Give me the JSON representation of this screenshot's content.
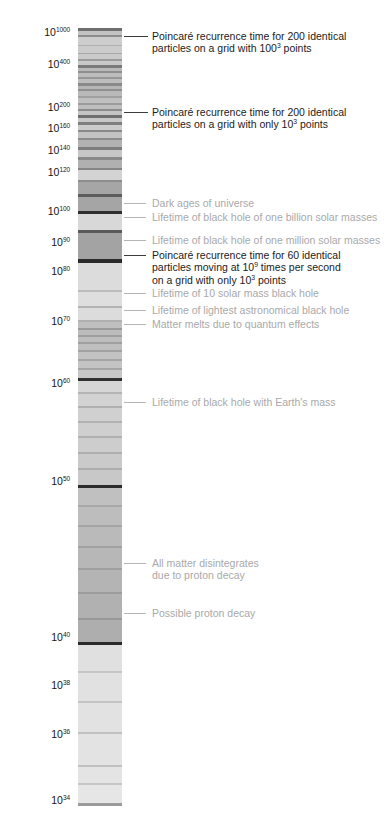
{
  "chart_data": {
    "type": "bar",
    "title": "",
    "subtitle": "",
    "xlabel": "",
    "ylabel": "",
    "orientation": "vertical-log-timeline",
    "scale": "log10-of-log10-years",
    "grid": false,
    "legend_position": "none",
    "axis": {
      "label_prefix": "10",
      "ticks": [
        {
          "exponent": "1000",
          "y": 33
        },
        {
          "exponent": "400",
          "y": 65
        },
        {
          "exponent": "200",
          "y": 108
        },
        {
          "exponent": "160",
          "y": 129
        },
        {
          "exponent": "140",
          "y": 151
        },
        {
          "exponent": "120",
          "y": 173
        },
        {
          "exponent": "100",
          "y": 212
        },
        {
          "exponent": "90",
          "y": 243
        },
        {
          "exponent": "80",
          "y": 272
        },
        {
          "exponent": "70",
          "y": 322
        },
        {
          "exponent": "60",
          "y": 384
        },
        {
          "exponent": "50",
          "y": 482
        },
        {
          "exponent": "40",
          "y": 638
        },
        {
          "exponent": "38",
          "y": 686
        },
        {
          "exponent": "36",
          "y": 735
        },
        {
          "exponent": "34",
          "y": 801
        }
      ]
    },
    "column": {
      "left": 78,
      "top": 28,
      "width": 44,
      "height": 778,
      "base_color": "#e8e8e8",
      "band_color_dark": "#2b2b2b",
      "band_color_mid": "#9a9a9a",
      "band_color_light": "#cfcfcf"
    },
    "annotations": [
      {
        "id": "poincare-200-100cubed",
        "style": "dark",
        "y": 30,
        "lines": [
          {
            "text": "Poincaré recurrence time for 200 identical"
          },
          {
            "text": "particles on a grid with 100",
            "sup": "3",
            "tail": " points"
          }
        ]
      },
      {
        "id": "poincare-200-10cubed",
        "style": "dark",
        "y": 106,
        "lines": [
          {
            "text": "Poincaré recurrence time for 200 identical"
          },
          {
            "text": "particles on a grid with only 10",
            "sup": "3",
            "tail": " points"
          }
        ]
      },
      {
        "id": "dark-ages",
        "style": "gray",
        "y": 197,
        "lines": [
          {
            "text": "Dark ages of universe"
          }
        ]
      },
      {
        "id": "bh-one-billion-solar",
        "style": "gray",
        "y": 211,
        "lines": [
          {
            "text": "Lifetime of black hole of one billion solar masses"
          }
        ]
      },
      {
        "id": "bh-one-million-solar",
        "style": "gray",
        "y": 234,
        "lines": [
          {
            "text": "Lifetime of black hole of one million solar masses"
          }
        ]
      },
      {
        "id": "poincare-60-particles",
        "style": "dark",
        "y": 249,
        "lines": [
          {
            "text": "Poincaré recurrence time for 60 identical"
          },
          {
            "text": "particles moving at 10",
            "sup": "9",
            "tail": " times per second"
          },
          {
            "text": "on a grid with only 10",
            "sup": "3",
            "tail": " points"
          }
        ]
      },
      {
        "id": "bh-10-solar-mass",
        "style": "gray",
        "y": 287,
        "lines": [
          {
            "text": "Lifetime of 10 solar mass black hole"
          }
        ]
      },
      {
        "id": "bh-lightest-astronomical",
        "style": "gray",
        "y": 304,
        "lines": [
          {
            "text": "Lifetime of lightest astronomical black hole"
          }
        ]
      },
      {
        "id": "matter-melts-quantum",
        "style": "gray",
        "y": 318,
        "lines": [
          {
            "text": "Matter melts due to quantum effects"
          }
        ]
      },
      {
        "id": "bh-earth-mass",
        "style": "gray",
        "y": 396,
        "lines": [
          {
            "text": "Lifetime of  black hole with Earth's mass"
          }
        ]
      },
      {
        "id": "all-matter-disintegrates",
        "style": "gray",
        "y": 557,
        "lines": [
          {
            "text": "All matter disintegrates"
          },
          {
            "text": "due to proton decay"
          }
        ]
      },
      {
        "id": "possible-proton-decay",
        "style": "gray",
        "y": 607,
        "lines": [
          {
            "text": "Possible proton decay"
          }
        ]
      }
    ],
    "leader_lines": [
      {
        "for": "poincare-200-100cubed",
        "x": 124,
        "w": 24,
        "y": 36,
        "style": "dark"
      },
      {
        "for": "poincare-200-10cubed",
        "x": 124,
        "w": 24,
        "y": 112,
        "style": "dark"
      },
      {
        "for": "dark-ages",
        "x": 124,
        "w": 22,
        "y": 203,
        "style": "gray"
      },
      {
        "for": "bh-one-billion-solar",
        "x": 124,
        "w": 22,
        "y": 217,
        "style": "gray"
      },
      {
        "for": "bh-one-million-solar",
        "x": 124,
        "w": 22,
        "y": 240,
        "style": "gray"
      },
      {
        "for": "poincare-60-particles",
        "x": 124,
        "w": 22,
        "y": 255,
        "style": "dark"
      },
      {
        "for": "bh-10-solar-mass",
        "x": 124,
        "w": 22,
        "y": 293,
        "style": "gray"
      },
      {
        "for": "bh-lightest-astronomical",
        "x": 124,
        "w": 22,
        "y": 310,
        "style": "gray"
      },
      {
        "for": "matter-melts-quantum",
        "x": 124,
        "w": 22,
        "y": 324,
        "style": "gray"
      },
      {
        "for": "bh-earth-mass",
        "x": 124,
        "w": 22,
        "y": 402,
        "style": "gray"
      },
      {
        "for": "all-matter-disintegrates",
        "x": 124,
        "w": 22,
        "y": 563,
        "style": "gray"
      },
      {
        "for": "possible-proton-decay",
        "x": 124,
        "w": 22,
        "y": 613,
        "style": "gray"
      }
    ],
    "bands": [
      {
        "y": 28,
        "h": 3,
        "c": "#6e6e6e"
      },
      {
        "y": 31,
        "h": 4,
        "c": "#c2c2c2"
      },
      {
        "y": 35,
        "h": 2,
        "c": "#8d8d8d"
      },
      {
        "y": 37,
        "h": 8,
        "c": "#cdcdcd"
      },
      {
        "y": 45,
        "h": 1,
        "c": "#b0b0b0"
      },
      {
        "y": 46,
        "h": 7,
        "c": "#cbcbcb"
      },
      {
        "y": 53,
        "h": 1,
        "c": "#a8a8a8"
      },
      {
        "y": 54,
        "h": 5,
        "c": "#cacaca"
      },
      {
        "y": 59,
        "h": 2,
        "c": "#9b9b9b"
      },
      {
        "y": 61,
        "h": 4,
        "c": "#c9c9c9"
      },
      {
        "y": 65,
        "h": 3,
        "c": "#7a7a7a"
      },
      {
        "y": 68,
        "h": 3,
        "c": "#b9b9b9"
      },
      {
        "y": 71,
        "h": 2,
        "c": "#8e8e8e"
      },
      {
        "y": 73,
        "h": 4,
        "c": "#bcbcbc"
      },
      {
        "y": 77,
        "h": 2,
        "c": "#969696"
      },
      {
        "y": 79,
        "h": 4,
        "c": "#bdbdbd"
      },
      {
        "y": 83,
        "h": 3,
        "c": "#8a8a8a"
      },
      {
        "y": 86,
        "h": 3,
        "c": "#b5b5b5"
      },
      {
        "y": 89,
        "h": 2,
        "c": "#8f8f8f"
      },
      {
        "y": 91,
        "h": 5,
        "c": "#b9b9b9"
      },
      {
        "y": 96,
        "h": 2,
        "c": "#a0a0a0"
      },
      {
        "y": 98,
        "h": 5,
        "c": "#c0c0c0"
      },
      {
        "y": 103,
        "h": 2,
        "c": "#9c9c9c"
      },
      {
        "y": 105,
        "h": 4,
        "c": "#bebebe"
      },
      {
        "y": 109,
        "h": 2,
        "c": "#8b8b8b"
      },
      {
        "y": 111,
        "h": 4,
        "c": "#c4c4c4"
      },
      {
        "y": 115,
        "h": 3,
        "c": "#6f6f6f"
      },
      {
        "y": 118,
        "h": 4,
        "c": "#c7c7c7"
      },
      {
        "y": 122,
        "h": 3,
        "c": "#7e7e7e"
      },
      {
        "y": 125,
        "h": 5,
        "c": "#cbcbcb"
      },
      {
        "y": 130,
        "h": 2,
        "c": "#888888"
      },
      {
        "y": 132,
        "h": 6,
        "c": "#c3c3c3"
      },
      {
        "y": 138,
        "h": 2,
        "c": "#8b8b8b"
      },
      {
        "y": 140,
        "h": 7,
        "c": "#b3b3b3"
      },
      {
        "y": 147,
        "h": 3,
        "c": "#7d7d7d"
      },
      {
        "y": 150,
        "h": 7,
        "c": "#c6c6c6"
      },
      {
        "y": 157,
        "h": 3,
        "c": "#888888"
      },
      {
        "y": 160,
        "h": 8,
        "c": "#b0b0b0"
      },
      {
        "y": 168,
        "h": 2,
        "c": "#858585"
      },
      {
        "y": 170,
        "h": 10,
        "c": "#d3d3d3"
      },
      {
        "y": 180,
        "h": 2,
        "c": "#8d8d8d"
      },
      {
        "y": 182,
        "h": 12,
        "c": "#a6a6a6"
      },
      {
        "y": 194,
        "h": 3,
        "c": "#5d5d5d"
      },
      {
        "y": 197,
        "h": 14,
        "c": "#a5a5a5"
      },
      {
        "y": 211,
        "h": 3,
        "c": "#2e2e2e"
      },
      {
        "y": 214,
        "h": 16,
        "c": "#d8d8d8"
      },
      {
        "y": 230,
        "h": 3,
        "c": "#5a5a5a"
      },
      {
        "y": 233,
        "h": 26,
        "c": "#a3a3a3"
      },
      {
        "y": 259,
        "h": 4,
        "c": "#2b2b2b"
      },
      {
        "y": 263,
        "h": 27,
        "c": "#dcdcdc"
      },
      {
        "y": 290,
        "h": 2,
        "c": "#bcbcbc"
      },
      {
        "y": 292,
        "h": 14,
        "c": "#dedede"
      },
      {
        "y": 306,
        "h": 2,
        "c": "#b3b3b3"
      },
      {
        "y": 308,
        "h": 12,
        "c": "#dcdcdc"
      },
      {
        "y": 320,
        "h": 2,
        "c": "#b0b0b0"
      },
      {
        "y": 322,
        "h": 6,
        "c": "#bfbfbf"
      },
      {
        "y": 328,
        "h": 2,
        "c": "#9a9a9a"
      },
      {
        "y": 330,
        "h": 5,
        "c": "#bcbcbc"
      },
      {
        "y": 335,
        "h": 2,
        "c": "#9e9e9e"
      },
      {
        "y": 337,
        "h": 5,
        "c": "#bdbdbd"
      },
      {
        "y": 342,
        "h": 2,
        "c": "#a0a0a0"
      },
      {
        "y": 344,
        "h": 6,
        "c": "#bfbfbf"
      },
      {
        "y": 350,
        "h": 2,
        "c": "#a2a2a2"
      },
      {
        "y": 352,
        "h": 7,
        "c": "#c2c2c2"
      },
      {
        "y": 359,
        "h": 2,
        "c": "#a4a4a4"
      },
      {
        "y": 361,
        "h": 7,
        "c": "#c4c4c4"
      },
      {
        "y": 368,
        "h": 2,
        "c": "#a6a6a6"
      },
      {
        "y": 370,
        "h": 8,
        "c": "#c6c6c6"
      },
      {
        "y": 378,
        "h": 3,
        "c": "#2f2f2f"
      },
      {
        "y": 381,
        "h": 11,
        "c": "#d6d6d6"
      },
      {
        "y": 392,
        "h": 2,
        "c": "#b4b4b4"
      },
      {
        "y": 394,
        "h": 12,
        "c": "#d2d2d2"
      },
      {
        "y": 406,
        "h": 2,
        "c": "#b0b0b0"
      },
      {
        "y": 408,
        "h": 13,
        "c": "#d0d0d0"
      },
      {
        "y": 421,
        "h": 2,
        "c": "#b2b2b2"
      },
      {
        "y": 423,
        "h": 13,
        "c": "#cfcfcf"
      },
      {
        "y": 436,
        "h": 2,
        "c": "#b0b0b0"
      },
      {
        "y": 438,
        "h": 14,
        "c": "#cdcdcd"
      },
      {
        "y": 452,
        "h": 2,
        "c": "#aeaeae"
      },
      {
        "y": 454,
        "h": 14,
        "c": "#cacaca"
      },
      {
        "y": 468,
        "h": 2,
        "c": "#adadad"
      },
      {
        "y": 470,
        "h": 15,
        "c": "#c8c8c8"
      },
      {
        "y": 485,
        "h": 3,
        "c": "#2c2c2c"
      },
      {
        "y": 488,
        "h": 17,
        "c": "#c0c0c0"
      },
      {
        "y": 505,
        "h": 2,
        "c": "#a8a8a8"
      },
      {
        "y": 507,
        "h": 18,
        "c": "#bdbdbd"
      },
      {
        "y": 525,
        "h": 2,
        "c": "#a5a5a5"
      },
      {
        "y": 527,
        "h": 19,
        "c": "#bababa"
      },
      {
        "y": 546,
        "h": 2,
        "c": "#a2a2a2"
      },
      {
        "y": 548,
        "h": 20,
        "c": "#b7b7b7"
      },
      {
        "y": 568,
        "h": 2,
        "c": "#9f9f9f"
      },
      {
        "y": 570,
        "h": 22,
        "c": "#b4b4b4"
      },
      {
        "y": 592,
        "h": 2,
        "c": "#9c9c9c"
      },
      {
        "y": 594,
        "h": 24,
        "c": "#b1b1b1"
      },
      {
        "y": 618,
        "h": 2,
        "c": "#999999"
      },
      {
        "y": 620,
        "h": 22,
        "c": "#aeaeae"
      },
      {
        "y": 642,
        "h": 3,
        "c": "#2a2a2a"
      },
      {
        "y": 645,
        "h": 26,
        "c": "#e0e0e0"
      },
      {
        "y": 671,
        "h": 2,
        "c": "#c6c6c6"
      },
      {
        "y": 673,
        "h": 28,
        "c": "#e1e1e1"
      },
      {
        "y": 701,
        "h": 2,
        "c": "#c4c4c4"
      },
      {
        "y": 703,
        "h": 29,
        "c": "#e2e2e2"
      },
      {
        "y": 732,
        "h": 2,
        "c": "#c2c2c2"
      },
      {
        "y": 734,
        "h": 31,
        "c": "#e3e3e3"
      },
      {
        "y": 765,
        "h": 2,
        "c": "#c0c0c0"
      },
      {
        "y": 767,
        "h": 16,
        "c": "#e4e4e4"
      },
      {
        "y": 783,
        "h": 2,
        "c": "#c6c6c6"
      },
      {
        "y": 785,
        "h": 18,
        "c": "#e6e6e6"
      },
      {
        "y": 803,
        "h": 3,
        "c": "#9a9a9a"
      }
    ]
  }
}
